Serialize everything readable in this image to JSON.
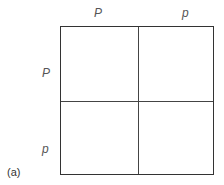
{
  "diagram": {
    "type": "punnett-square",
    "column_headers": [
      "P",
      "p"
    ],
    "row_headers": [
      "P",
      "p"
    ],
    "cells": [
      [
        "",
        ""
      ],
      [
        "",
        ""
      ]
    ],
    "caption": "(a)"
  }
}
